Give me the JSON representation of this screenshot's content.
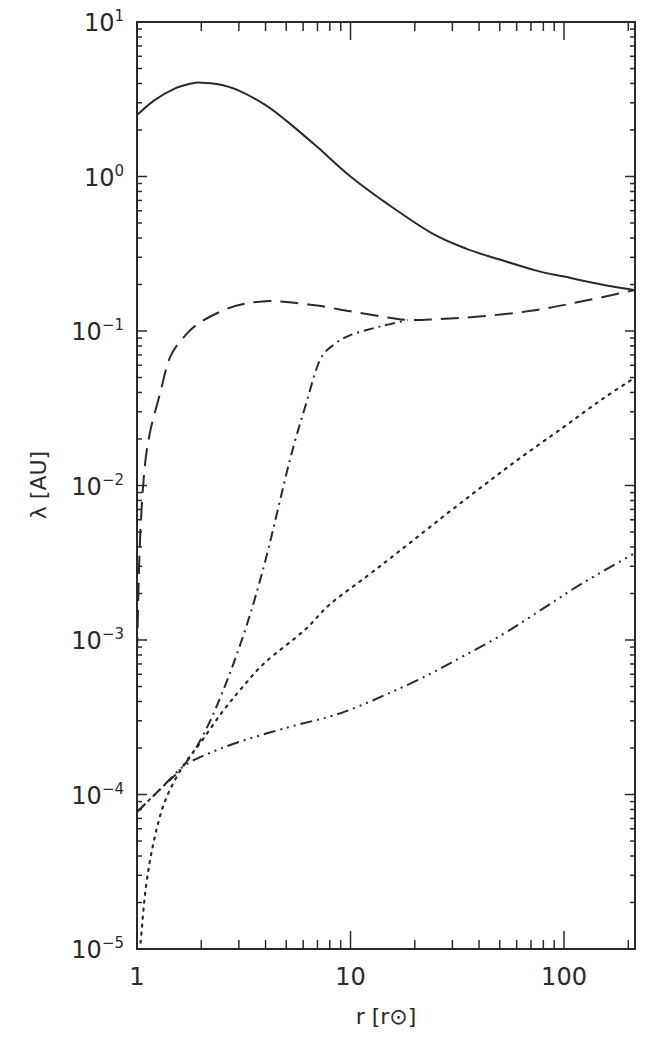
{
  "chart_data": {
    "type": "line",
    "title": "",
    "xlabel": "r [r⊙]",
    "ylabel": "λ [AU]",
    "xscale": "log",
    "yscale": "log",
    "xlim": [
      1,
      215
    ],
    "ylim": [
      1e-05,
      10
    ],
    "grid": false,
    "legend": "none",
    "x_ticks": [
      {
        "value": 1,
        "label": "1"
      },
      {
        "value": 10,
        "label": "10"
      },
      {
        "value": 100,
        "label": "100"
      }
    ],
    "y_ticks": [
      {
        "value": 10,
        "base": "10",
        "exp": "1"
      },
      {
        "value": 1,
        "base": "10",
        "exp": "0"
      },
      {
        "value": 0.1,
        "base": "10",
        "exp": "−1"
      },
      {
        "value": 0.01,
        "base": "10",
        "exp": "−2"
      },
      {
        "value": 0.001,
        "base": "10",
        "exp": "−3"
      },
      {
        "value": 0.0001,
        "base": "10",
        "exp": "−4"
      },
      {
        "value": 1e-05,
        "base": "10",
        "exp": "−5"
      }
    ],
    "series": [
      {
        "name": "solid",
        "style": "solid",
        "x": [
          1.0,
          1.2,
          1.5,
          1.8,
          2.0,
          2.4,
          3.0,
          4.0,
          5.0,
          7.0,
          10,
          15,
          24,
          35,
          50,
          75,
          100,
          150,
          215
        ],
        "y": [
          2.5,
          3.1,
          3.7,
          4.0,
          4.05,
          3.95,
          3.6,
          2.9,
          2.3,
          1.55,
          1.0,
          0.66,
          0.43,
          0.34,
          0.29,
          0.245,
          0.225,
          0.2,
          0.184
        ]
      },
      {
        "name": "long-dash",
        "style": "longdash",
        "x": [
          1.0,
          1.03,
          1.08,
          1.15,
          1.28,
          1.43,
          1.7,
          2.0,
          2.6,
          3.2,
          4.0,
          5.0,
          7.0,
          10,
          14,
          18.5,
          25,
          40,
          70,
          120,
          215
        ],
        "y": [
          0.0008,
          0.004,
          0.012,
          0.022,
          0.039,
          0.068,
          0.095,
          0.115,
          0.138,
          0.15,
          0.156,
          0.154,
          0.146,
          0.134,
          0.124,
          0.118,
          0.119,
          0.124,
          0.135,
          0.155,
          0.184
        ]
      },
      {
        "name": "dash-dot",
        "style": "dashdot",
        "x": [
          1.0,
          1.3,
          1.63,
          2.0,
          2.5,
          3.21,
          4.0,
          5.2,
          6.2,
          7.2,
          8.5,
          10,
          12.7,
          15,
          18.5
        ],
        "y": [
          7.7e-05,
          0.00011,
          0.00015,
          0.00023,
          0.00045,
          0.00116,
          0.0033,
          0.0146,
          0.034,
          0.065,
          0.083,
          0.094,
          0.104,
          0.11,
          0.118
        ]
      },
      {
        "name": "dotted",
        "style": "dotted",
        "x": [
          1.04,
          1.1,
          1.2,
          1.35,
          1.63,
          2.0,
          2.5,
          3.1,
          4.0,
          6.1,
          8.0,
          12,
          17.1,
          26.4,
          40,
          60,
          100,
          150,
          215
        ],
        "y": [
          1.1e-05,
          2.5e-05,
          5e-05,
          9e-05,
          0.00015,
          0.00022,
          0.00034,
          0.00049,
          0.00072,
          0.00116,
          0.0017,
          0.0026,
          0.0038,
          0.0061,
          0.0095,
          0.0145,
          0.024,
          0.036,
          0.05
        ]
      },
      {
        "name": "dash-dot-dot-dot",
        "style": "dashdotdotdot",
        "x": [
          1.0,
          1.3,
          1.63,
          2.08,
          3.04,
          5.0,
          8.0,
          10.8,
          15,
          21.2,
          30,
          50.6,
          80,
          120,
          215
        ],
        "y": [
          7.7e-05,
          0.00011,
          0.00015,
          0.00018,
          0.00022,
          0.00027,
          0.00032,
          0.00037,
          0.00045,
          0.00056,
          0.00072,
          0.00107,
          0.0016,
          0.0023,
          0.00366
        ]
      }
    ]
  }
}
